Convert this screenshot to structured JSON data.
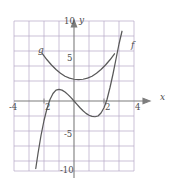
{
  "figure": {
    "kind": "cartesian-graph",
    "background": "#ffffff",
    "width": 178,
    "height": 185
  },
  "chart_data": {
    "type": "line",
    "title": "",
    "xlabel": "x",
    "ylabel": "y",
    "xlim": [
      -4,
      4
    ],
    "ylim": [
      -10,
      10
    ],
    "grid": true,
    "grid_step_x": 1,
    "grid_step_y": 2,
    "legend": "inline-curve-labels",
    "axis_color": "#808080",
    "grid_color": "#b3a6c4",
    "curve_color": "#595959",
    "xticks": [
      -4,
      4
    ],
    "xtick_labels": [
      "-4",
      "4"
    ],
    "yticks": [
      -10,
      -5,
      5,
      10
    ],
    "ytick_labels": [
      "-10",
      "-5",
      "5",
      "10"
    ],
    "inner_x_marks": [
      -2,
      2
    ],
    "inner_x_mark_labels": [
      "2",
      "2"
    ],
    "series": [
      {
        "name": "g",
        "label": "g",
        "label_x": -2.25,
        "label_y": 6.0,
        "equation": "parabola opening upward",
        "x": [
          -2.1,
          -1.8,
          -1.5,
          -1.2,
          -0.9,
          -0.6,
          -0.3,
          0.0,
          0.3,
          0.6,
          0.9,
          1.2,
          1.5,
          1.8,
          2.1,
          2.4,
          2.7
        ],
        "y": [
          6.3,
          5.5,
          4.8,
          4.2,
          3.7,
          3.3,
          3.05,
          2.9,
          2.85,
          2.9,
          3.05,
          3.3,
          3.7,
          4.2,
          4.8,
          5.5,
          6.3
        ]
      },
      {
        "name": "f",
        "label": "f",
        "label_x": 3.3,
        "label_y": 7.0,
        "equation": "cubic with local max near x=-1.2 and local min near x=1.5",
        "x": [
          -2.55,
          -2.4,
          -2.2,
          -2.0,
          -1.8,
          -1.6,
          -1.4,
          -1.2,
          -1.0,
          -0.8,
          -0.6,
          -0.4,
          -0.2,
          0.0,
          0.2,
          0.4,
          0.6,
          0.8,
          1.0,
          1.2,
          1.4,
          1.6,
          1.8,
          2.0,
          2.2,
          2.4,
          2.6,
          2.8,
          3.0,
          3.2
        ],
        "y": [
          -9.0,
          -7.0,
          -4.6,
          -2.6,
          -1.0,
          0.2,
          1.0,
          1.45,
          1.55,
          1.45,
          1.2,
          0.85,
          0.45,
          0.0,
          -0.45,
          -0.9,
          -1.3,
          -1.65,
          -1.9,
          -2.05,
          -2.1,
          -2.0,
          -1.6,
          -0.9,
          0.2,
          1.8,
          3.6,
          5.6,
          7.6,
          9.3
        ]
      }
    ]
  },
  "labels": {
    "x_axis": "x",
    "y_axis": "y",
    "curve_f": "f",
    "curve_g": "g",
    "tick_neg4": "-4",
    "tick_pos4": "4",
    "tick_neg2_inner": "2",
    "tick_pos2_inner": "2",
    "tick_5": "5",
    "tick_10": "10",
    "tick_neg5": "-5",
    "tick_neg10": "-10"
  }
}
